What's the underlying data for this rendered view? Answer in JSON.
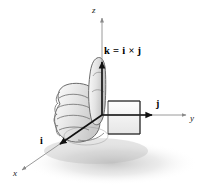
{
  "figure": {
    "background_color": "#ffffff",
    "line_color": "#1a1a1a",
    "hand_fill": "#d9d9d9",
    "hand_outline": "#6e6e6e"
  },
  "axes": [
    {
      "name": "z-axis",
      "label": "z",
      "direction": "up"
    },
    {
      "name": "y-axis",
      "label": "y",
      "direction": "right"
    },
    {
      "name": "x-axis",
      "label": "x",
      "direction": "down-left"
    }
  ],
  "vectors": [
    {
      "name": "i-vector",
      "label": "i",
      "along": "x-axis"
    },
    {
      "name": "j-vector",
      "label": "j",
      "along": "y-axis"
    },
    {
      "name": "k-vector",
      "label": "k = i × j",
      "along": "z-axis"
    }
  ],
  "annotations": {
    "z_label": "z",
    "y_label": "y",
    "x_label": "x",
    "i_label": "i",
    "j_label": "j",
    "k_equation": "k = i × j"
  },
  "illustration": {
    "subject": "right hand closed in a fist with thumb pointing upward",
    "shadow": true
  }
}
